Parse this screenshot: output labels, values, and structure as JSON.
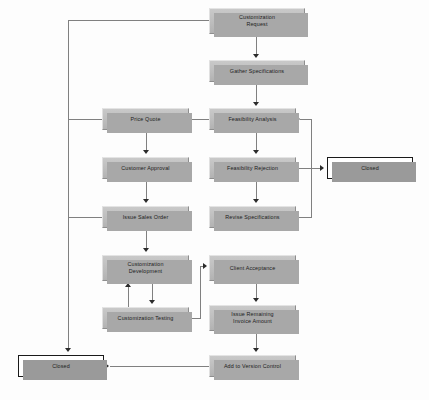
{
  "diagram": {
    "background_color": "#fdfdfd",
    "node_fill_color": "#bdbdbd",
    "node_shadow_color": "#a8a8a8",
    "terminator_fill_color": "#ffffff",
    "terminator_border_color": "#1a1a1a",
    "connector_color": "#808080",
    "arrowhead_color": "#2b2b2b"
  },
  "nodes": [
    {
      "id": "customization_request",
      "label": "Customization Request",
      "line1": "Customization",
      "line2": "Request",
      "type": "process",
      "x": 209,
      "y": 8,
      "w": 96,
      "h": 26
    },
    {
      "id": "gather_specifications",
      "label": "Gather Specifications",
      "line1": "Gather Specifications",
      "line2": "",
      "type": "process",
      "x": 209,
      "y": 60,
      "w": 96,
      "h": 22
    },
    {
      "id": "price_quote",
      "label": "Price Quote",
      "line1": "Price Quote",
      "line2": "",
      "type": "process",
      "x": 102,
      "y": 108,
      "w": 87,
      "h": 22
    },
    {
      "id": "feasibility_analysis",
      "label": "Feasibility Analysis",
      "line1": "Feasibility Analysis",
      "line2": "",
      "type": "process",
      "x": 209,
      "y": 108,
      "w": 87,
      "h": 22
    },
    {
      "id": "customer_approval",
      "label": "Customer Approval",
      "line1": "Customer Approval",
      "line2": "",
      "type": "process",
      "x": 102,
      "y": 157,
      "w": 87,
      "h": 22
    },
    {
      "id": "feasibility_rejection",
      "label": "Feasibility Rejection",
      "line1": "Feasibility Rejection",
      "line2": "",
      "type": "process",
      "x": 209,
      "y": 157,
      "w": 87,
      "h": 22
    },
    {
      "id": "closed_right",
      "label": "Closed",
      "line1": "Closed",
      "line2": "",
      "type": "terminator",
      "x": 327,
      "y": 157,
      "w": 86,
      "h": 22
    },
    {
      "id": "issue_sales_order",
      "label": "Issue Sales Order",
      "line1": "Issue Sales Order",
      "line2": "",
      "type": "process",
      "x": 102,
      "y": 206,
      "w": 87,
      "h": 22
    },
    {
      "id": "revise_specifications",
      "label": "Revise Specifications",
      "line1": "Revise Specifications",
      "line2": "",
      "type": "process",
      "x": 209,
      "y": 206,
      "w": 87,
      "h": 22
    },
    {
      "id": "customization_development",
      "label": "Customization Development",
      "line1": "Customization",
      "line2": "Development",
      "type": "process",
      "x": 102,
      "y": 255,
      "w": 87,
      "h": 26
    },
    {
      "id": "client_acceptance",
      "label": "Client Acceptance",
      "line1": "Client Acceptance",
      "line2": "",
      "type": "process",
      "x": 209,
      "y": 255,
      "w": 87,
      "h": 26
    },
    {
      "id": "customization_testing",
      "label": "Customization Testing",
      "line1": "Customization Testing",
      "line2": "",
      "type": "process",
      "x": 102,
      "y": 307,
      "w": 87,
      "h": 22
    },
    {
      "id": "issue_remaining_invoice",
      "label": "Issue Remaining Invoice Amount",
      "line1": "Issue Remaining",
      "line2": "Invoice Amount",
      "type": "process",
      "x": 209,
      "y": 305,
      "w": 87,
      "h": 26
    },
    {
      "id": "closed_left",
      "label": "Closed",
      "line1": "Closed",
      "line2": "",
      "type": "terminator",
      "x": 18,
      "y": 355,
      "w": 86,
      "h": 22
    },
    {
      "id": "add_to_version_control",
      "label": "Add to Version Control",
      "line1": "Add to Version Control",
      "line2": "",
      "type": "process",
      "x": 209,
      "y": 355,
      "w": 87,
      "h": 22
    }
  ],
  "edges": [
    {
      "from": "customization_request",
      "to": "gather_specifications",
      "label": ""
    },
    {
      "from": "gather_specifications",
      "to": "feasibility_analysis",
      "label": ""
    },
    {
      "from": "feasibility_analysis",
      "to": "price_quote",
      "label": ""
    },
    {
      "from": "feasibility_analysis",
      "to": "feasibility_rejection",
      "label": ""
    },
    {
      "from": "price_quote",
      "to": "customer_approval",
      "label": ""
    },
    {
      "from": "customer_approval",
      "to": "issue_sales_order",
      "label": ""
    },
    {
      "from": "feasibility_rejection",
      "to": "closed_right",
      "label": ""
    },
    {
      "from": "feasibility_rejection",
      "to": "revise_specifications",
      "label": ""
    },
    {
      "from": "revise_specifications",
      "to": "feasibility_analysis",
      "label": ""
    },
    {
      "from": "issue_sales_order",
      "to": "customization_development",
      "label": ""
    },
    {
      "from": "customization_development",
      "to": "customization_testing",
      "label": ""
    },
    {
      "from": "customization_testing",
      "to": "customization_development",
      "label": ""
    },
    {
      "from": "customization_testing",
      "to": "client_acceptance",
      "label": ""
    },
    {
      "from": "client_acceptance",
      "to": "issue_remaining_invoice",
      "label": ""
    },
    {
      "from": "issue_remaining_invoice",
      "to": "add_to_version_control",
      "label": ""
    },
    {
      "from": "add_to_version_control",
      "to": "closed_left",
      "label": ""
    },
    {
      "from": "customization_request",
      "to": "price_quote",
      "label": ""
    },
    {
      "from": "customization_request",
      "to": "issue_sales_order",
      "label": ""
    },
    {
      "from": "customization_request",
      "to": "closed_left",
      "label": ""
    }
  ]
}
